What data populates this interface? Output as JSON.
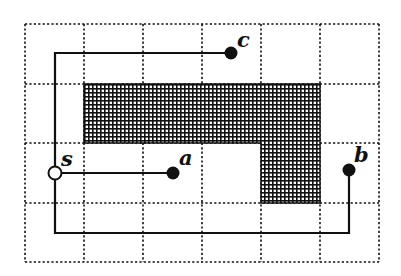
{
  "diagram": {
    "type": "grid-path-diagram",
    "grid": {
      "columns": 6,
      "rows": 4,
      "x_lines": [
        25,
        84,
        143,
        202,
        261,
        320,
        379
      ],
      "y_lines": [
        24,
        84,
        143,
        203,
        262
      ],
      "line_style": "dotted",
      "color": "#111111"
    },
    "obstacle": {
      "fill_pattern": "crosshatch",
      "color": "#111111",
      "shape_points": "84,84 320,84 320,203 261,203 261,143 84,143"
    },
    "nodes": [
      {
        "id": "s",
        "label": "s",
        "x": 55,
        "y": 173,
        "style": "hollow",
        "label_x": 61,
        "label_y": 166
      },
      {
        "id": "a",
        "label": "a",
        "x": 173,
        "y": 173,
        "style": "filled",
        "label_x": 179,
        "label_y": 165
      },
      {
        "id": "b",
        "label": "b",
        "x": 349,
        "y": 170,
        "style": "filled",
        "label_x": 354,
        "label_y": 162
      },
      {
        "id": "c",
        "label": "c",
        "x": 231,
        "y": 53,
        "style": "filled",
        "label_x": 237,
        "label_y": 47
      }
    ],
    "paths": [
      {
        "from": "s",
        "to": "c",
        "points": "55,173 55,53 231,53"
      },
      {
        "from": "s",
        "to": "a",
        "points": "55,173 173,173"
      },
      {
        "from": "s",
        "to": "b",
        "points": "55,173 55,233 349,233 349,170"
      }
    ]
  }
}
